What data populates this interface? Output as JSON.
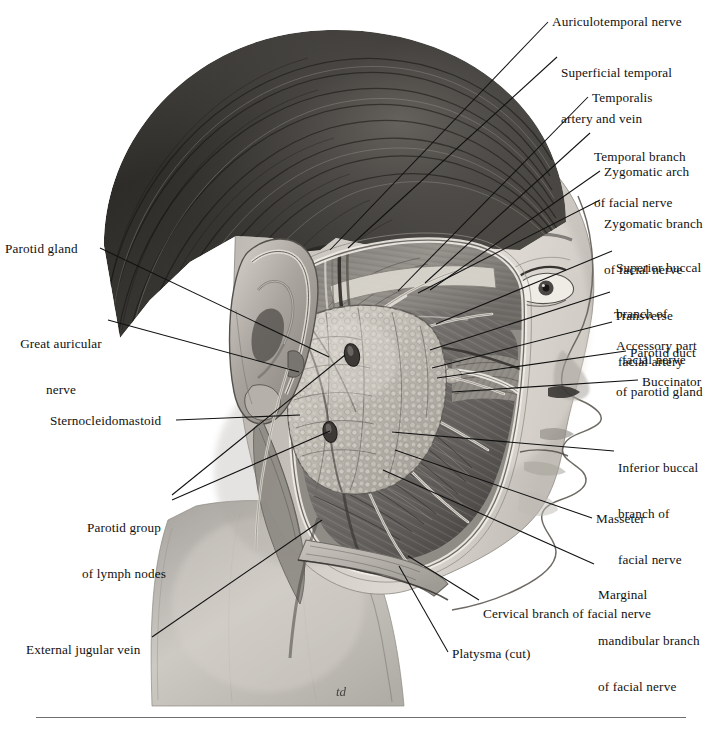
{
  "plate": {
    "title": "Parotid region, superficial dissection, lateral view",
    "subject": "Lateral view of human head showing parotid gland and branches of the facial nerve",
    "signature": "td",
    "background_color": "#ffffff",
    "ink_color": "#111111",
    "rule_color": "#6f6f6f"
  },
  "labels": [
    {
      "id": "auriculotemporal-nerve",
      "text": "Auriculotemporal nerve",
      "side": "right",
      "x": 552,
      "y": 14,
      "lines": [
        "Auriculotemporal nerve"
      ]
    },
    {
      "id": "superficial-temporal-artery-and-vein",
      "text": "Superficial temporal artery and vein",
      "side": "right",
      "x": 561,
      "y": 35,
      "lines": [
        "Superficial temporal",
        "artery and vein"
      ]
    },
    {
      "id": "temporalis",
      "text": "Temporalis",
      "side": "right",
      "x": 592,
      "y": 90,
      "lines": [
        "Temporalis"
      ]
    },
    {
      "id": "temporal-branch-of-facial-nerve",
      "text": "Temporal branch of facial nerve",
      "side": "right",
      "x": 594,
      "y": 119,
      "lines": [
        "Temporal branch",
        "of facial nerve"
      ]
    },
    {
      "id": "zygomatic-arch",
      "text": "Zygomatic arch",
      "side": "right",
      "x": 604,
      "y": 164,
      "lines": [
        "Zygomatic arch"
      ]
    },
    {
      "id": "zygomatic-branch-of-facial-nerve",
      "text": "Zygomatic branch of facial nerve",
      "side": "right",
      "x": 604,
      "y": 186,
      "lines": [
        "Zygomatic branch",
        "of facial nerve"
      ]
    },
    {
      "id": "superior-buccal-branch-of-facial-nerve",
      "text": "Superior buccal branch of facial nerve",
      "side": "right",
      "x": 616,
      "y": 230,
      "lines": [
        "Superior buccal",
        "branch of",
        "facial nerve"
      ]
    },
    {
      "id": "transverse-facial-artery",
      "text": "Transverse facial artery",
      "side": "right",
      "x": 614,
      "y": 278,
      "lines": [
        "Transverse",
        "facial artery"
      ]
    },
    {
      "id": "accessory-part-of-parotid-gland",
      "text": "Accessory part of parotid gland",
      "side": "right",
      "x": 616,
      "y": 308,
      "lines": [
        "Accessory part",
        "of parotid gland"
      ]
    },
    {
      "id": "parotid-duct",
      "text": "Parotid duct",
      "side": "right",
      "x": 630,
      "y": 345,
      "lines": [
        "Parotid duct"
      ]
    },
    {
      "id": "buccinator",
      "text": "Buccinator",
      "side": "right",
      "x": 642,
      "y": 374,
      "lines": [
        "Buccinator"
      ]
    },
    {
      "id": "inferior-buccal-branch-of-facial-nerve",
      "text": "Inferior buccal branch of facial nerve",
      "side": "right",
      "x": 618,
      "y": 430,
      "lines": [
        "Inferior buccal",
        "branch of",
        "facial nerve"
      ]
    },
    {
      "id": "masseter",
      "text": "Masseter",
      "side": "right",
      "x": 596,
      "y": 511,
      "lines": [
        "Masseter"
      ]
    },
    {
      "id": "marginal-mandibular-branch-of-facial-nerve",
      "text": "Marginal mandibular branch of facial nerve",
      "side": "right",
      "x": 598,
      "y": 557,
      "lines": [
        "Marginal",
        "mandibular branch",
        "of facial nerve"
      ]
    },
    {
      "id": "cervical-branch-of-facial-nerve",
      "text": "Cervical branch of facial nerve",
      "side": "right",
      "x": 483,
      "y": 606,
      "lines": [
        "Cervical branch of facial nerve"
      ]
    },
    {
      "id": "platysma-cut",
      "text": "Platysma (cut)",
      "side": "right",
      "x": 452,
      "y": 646,
      "lines": [
        "Platysma (cut)"
      ]
    },
    {
      "id": "parotid-gland",
      "text": "Parotid gland",
      "side": "left",
      "x": 5,
      "y": 241,
      "lines": [
        "Parotid gland"
      ]
    },
    {
      "id": "great-auricular-nerve",
      "text": "Great auricular nerve",
      "side": "left",
      "x": 11,
      "y": 306,
      "lines": [
        "Great auricular",
        "nerve"
      ],
      "align": "center"
    },
    {
      "id": "sternocleidomastoid",
      "text": "Sternocleidomastoid",
      "side": "left",
      "x": 50,
      "y": 413,
      "lines": [
        "Sternocleidomastoid"
      ]
    },
    {
      "id": "parotid-group-of-lymph-nodes",
      "text": "Parotid group of lymph nodes",
      "side": "left",
      "x": 76,
      "y": 490,
      "lines": [
        "Parotid group",
        "of lymph nodes"
      ],
      "align": "center"
    },
    {
      "id": "external-jugular-vein",
      "text": "External jugular vein",
      "side": "left",
      "x": 26,
      "y": 642,
      "lines": [
        "External jugular vein"
      ]
    }
  ],
  "leader_lines": [
    {
      "for": "auriculotemporal-nerve",
      "from": [
        548,
        22
      ],
      "to": [
        330,
        250
      ]
    },
    {
      "for": "superficial-temporal-artery-and-vein",
      "from": [
        557,
        57
      ],
      "to": [
        348,
        248
      ]
    },
    {
      "for": "temporalis",
      "from": [
        588,
        97
      ],
      "to": [
        398,
        291
      ]
    },
    {
      "for": "temporal-branch-of-facial-nerve",
      "from": [
        590,
        133
      ],
      "to": [
        425,
        283
      ]
    },
    {
      "for": "zygomatic-arch",
      "from": [
        600,
        171
      ],
      "to": [
        430,
        290
      ]
    },
    {
      "for": "zygomatic-branch-of-facial-nerve",
      "from": [
        600,
        200
      ],
      "to": [
        418,
        293
      ]
    },
    {
      "for": "superior-buccal-branch-of-facial-nerve",
      "from": [
        612,
        251
      ],
      "to": [
        436,
        324
      ]
    },
    {
      "for": "transverse-facial-artery",
      "from": [
        610,
        292
      ],
      "to": [
        430,
        350
      ]
    },
    {
      "for": "accessory-part-of-parotid-gland",
      "from": [
        612,
        322
      ],
      "to": [
        432,
        368
      ]
    },
    {
      "for": "parotid-duct",
      "from": [
        626,
        351
      ],
      "to": [
        437,
        378
      ]
    },
    {
      "for": "buccinator",
      "from": [
        638,
        380
      ],
      "to": [
        452,
        392
      ]
    },
    {
      "for": "inferior-buccal-branch-of-facial-nerve",
      "from": [
        614,
        451
      ],
      "to": [
        392,
        432
      ]
    },
    {
      "for": "masseter",
      "from": [
        592,
        518
      ],
      "to": [
        395,
        450
      ]
    },
    {
      "for": "marginal-mandibular-branch-of-facial-nerve",
      "from": [
        594,
        564
      ],
      "to": [
        383,
        470
      ]
    },
    {
      "for": "cervical-branch-of-facial-nerve",
      "from": [
        479,
        600
      ],
      "to": [
        408,
        556
      ]
    },
    {
      "for": "platysma-cut",
      "from": [
        448,
        652
      ],
      "to": [
        399,
        566
      ]
    },
    {
      "for": "parotid-gland",
      "from": [
        100,
        248
      ],
      "to": [
        329,
        357
      ]
    },
    {
      "for": "great-auricular-nerve",
      "from": [
        108,
        320
      ],
      "to": [
        299,
        372
      ]
    },
    {
      "for": "sternocleidomastoid",
      "from": [
        176,
        420
      ],
      "to": [
        300,
        415
      ]
    },
    {
      "for": "parotid-group-of-lymph-nodes-a",
      "from": [
        172,
        495
      ],
      "to": [
        345,
        355
      ]
    },
    {
      "for": "parotid-group-of-lymph-nodes-b",
      "from": [
        172,
        500
      ],
      "to": [
        330,
        431
      ]
    },
    {
      "for": "external-jugular-vein",
      "from": [
        152,
        637
      ],
      "to": [
        322,
        520
      ]
    }
  ]
}
